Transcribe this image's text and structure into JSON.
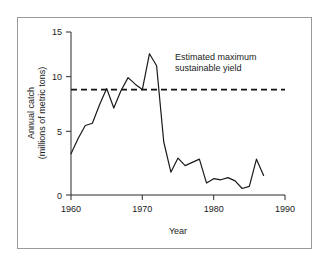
{
  "figure": {
    "frame_border_color": "#9a9a9a",
    "background_color": "#ffffff",
    "line_color": "#1a1a1a",
    "threshold_color": "#111111"
  },
  "chart_data": {
    "type": "line",
    "title": "",
    "subtitle": "",
    "xlabel": "Year",
    "ylabel_line1": "Annual catch",
    "ylabel_line2": "(millions of metric tons)",
    "xlim": [
      1960,
      1990
    ],
    "ylim": [
      0,
      15
    ],
    "xticks": [
      1960,
      1970,
      1980,
      1990
    ],
    "xtick_labels": [
      "1960",
      "1970",
      "1980",
      "1990"
    ],
    "yticks": [
      0,
      5,
      10,
      15
    ],
    "ytick_labels": [
      "0",
      "5",
      "10",
      "15"
    ],
    "grid": false,
    "legend": "none",
    "series": [
      {
        "name": "Annual catch",
        "x": [
          1960,
          1961,
          1962,
          1963,
          1964,
          1965,
          1966,
          1967,
          1968,
          1969,
          1970,
          1971,
          1972,
          1973,
          1974,
          1975,
          1976,
          1977,
          1978,
          1979,
          1980,
          1981,
          1982,
          1983,
          1984,
          1985,
          1986,
          1987
        ],
        "values": [
          3.8,
          5.2,
          6.4,
          6.6,
          8.3,
          9.8,
          8.0,
          9.6,
          10.8,
          10.2,
          9.7,
          13.0,
          11.9,
          4.9,
          2.1,
          3.4,
          2.7,
          3.0,
          3.3,
          1.1,
          1.5,
          1.4,
          1.6,
          1.3,
          0.6,
          0.8,
          3.3,
          1.8
        ]
      }
    ],
    "threshold": {
      "value": 9.7,
      "style": "dashed",
      "label_line1": "Estimated maximum",
      "label_line2": "sustainable yield",
      "label_x_year": 1974.5,
      "label_y_value": 12.3
    }
  }
}
